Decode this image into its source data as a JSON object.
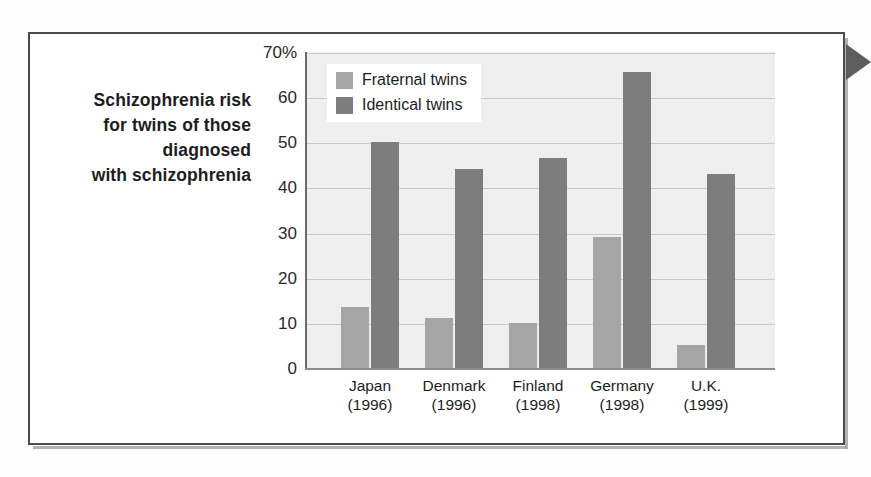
{
  "caption": {
    "lines": [
      "Schizophrenia risk",
      "for twins of those",
      "diagnosed",
      "with schizophrenia"
    ]
  },
  "legend": {
    "position": "top-left-inside-plot",
    "entries": [
      {
        "label": "Fraternal twins",
        "color": "#a5a5a5"
      },
      {
        "label": "Identical twins",
        "color": "#7d7d7d"
      }
    ]
  },
  "axis": {
    "y_ticks": [
      "70%",
      "60",
      "50",
      "40",
      "30",
      "20",
      "10",
      "0"
    ],
    "y_tick_values": [
      70,
      60,
      50,
      40,
      30,
      20,
      10,
      0
    ]
  },
  "chart_data": {
    "type": "bar",
    "title": "Schizophrenia risk for twins of those diagnosed with schizophrenia",
    "xlabel": "",
    "ylabel": "",
    "ylim": [
      0,
      70
    ],
    "yticks": [
      0,
      10,
      20,
      30,
      40,
      50,
      60,
      70
    ],
    "ytick_labels": [
      "0",
      "10",
      "20",
      "30",
      "40",
      "50",
      "60",
      "70%"
    ],
    "grid": true,
    "legend_position": "upper left",
    "categories": [
      "Japan\n(1996)",
      "Denmark\n(1996)",
      "Finland\n(1998)",
      "Germany\n(1998)",
      "U.K.\n(1999)"
    ],
    "category_names": [
      "Japan",
      "Denmark",
      "Finland",
      "Germany",
      "U.K."
    ],
    "category_years": [
      "(1996)",
      "(1996)",
      "(1998)",
      "(1998)",
      "(1999)"
    ],
    "series": [
      {
        "name": "Fraternal twins",
        "color": "#a5a5a5",
        "values": [
          13.5,
          11,
          10,
          29,
          5
        ]
      },
      {
        "name": "Identical twins",
        "color": "#7d7d7d",
        "values": [
          50,
          44,
          46.5,
          65.5,
          43
        ]
      }
    ]
  },
  "decor": {
    "arrow_name": "right-pointing-arrow-tab",
    "arrow_color": "#5d5d5d",
    "frame_color": "#4c4c4c",
    "plot_background": "#efefef"
  }
}
